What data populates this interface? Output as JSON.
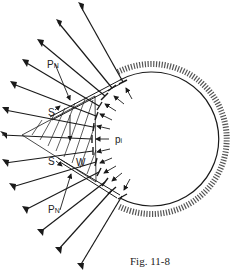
{
  "figure": {
    "caption": "Fig. 11-8",
    "labels": {
      "pn_top": {
        "main": "P",
        "sub": "N"
      },
      "s_top": "S",
      "pi": {
        "main": "p",
        "sub": "i"
      },
      "w": "W",
      "s_bottom": "S",
      "pn_bottom": {
        "main": "P",
        "sub": "N"
      }
    },
    "colors": {
      "ink": "#1a1a1a",
      "background": "#ffffff"
    }
  }
}
